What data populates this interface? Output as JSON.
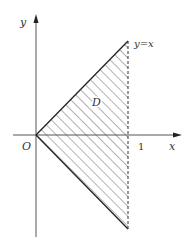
{
  "diagram": {
    "type": "region-plot",
    "axes": {
      "x_label": "x",
      "y_label": "y",
      "origin_label": "O",
      "x_tick_label": "1"
    },
    "curves": [
      {
        "name": "upper-boundary",
        "label": "y=x"
      },
      {
        "name": "lower-boundary",
        "label": ""
      },
      {
        "name": "vertical-boundary",
        "label": "",
        "style": "dashed"
      }
    ],
    "region": {
      "label": "D",
      "fill": "hatched"
    },
    "colors": {
      "axis": "#555555",
      "boundary": "#222222",
      "hatch": "#666666"
    }
  }
}
